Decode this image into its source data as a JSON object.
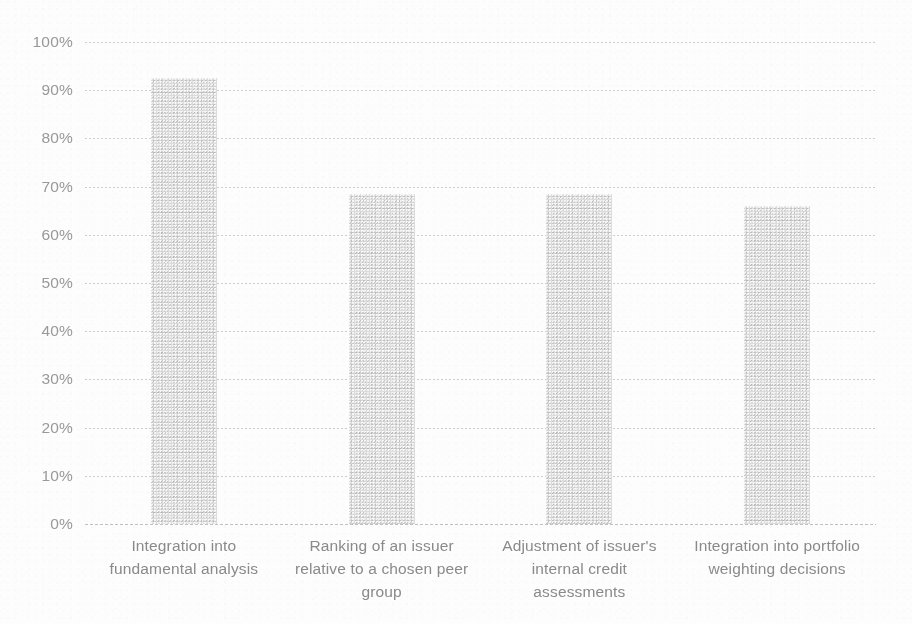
{
  "chart_data": {
    "type": "bar",
    "title": "",
    "subtitle": "",
    "xlabel": "",
    "ylabel": "",
    "ylim": [
      0,
      100
    ],
    "y_tick_labels": [
      "100%",
      "90%",
      "80%",
      "70%",
      "60%",
      "50%",
      "40%",
      "30%",
      "20%",
      "10%",
      "0%"
    ],
    "y_tick_values": [
      100,
      90,
      80,
      70,
      60,
      50,
      40,
      30,
      20,
      10,
      0
    ],
    "grid": "horizontal-dotted",
    "legend": "none",
    "categories": [
      "Integration into fundamental analysis",
      "Ranking of an issuer relative to a chosen peer group",
      "Adjustment of issuer's internal credit assessments",
      "Integration into portfolio weighting decisions"
    ],
    "values": [
      92.5,
      68.5,
      68.5,
      66
    ],
    "value_labels": [
      "",
      "",
      "",
      ""
    ],
    "bar_color": "#dcdcdc",
    "text_color": "#8a8a8a",
    "gridline_color": "#969696",
    "background_color": "#fdfdfd"
  },
  "axis": {
    "y_ticks": [
      {
        "label": "100%",
        "value": 100
      },
      {
        "label": "90%",
        "value": 90
      },
      {
        "label": "80%",
        "value": 80
      },
      {
        "label": "70%",
        "value": 70
      },
      {
        "label": "60%",
        "value": 60
      },
      {
        "label": "50%",
        "value": 50
      },
      {
        "label": "40%",
        "value": 40
      },
      {
        "label": "30%",
        "value": 30
      },
      {
        "label": "20%",
        "value": 20
      },
      {
        "label": "10%",
        "value": 10
      },
      {
        "label": "0%",
        "value": 0
      }
    ]
  },
  "categories": [
    {
      "line1": "Integration into",
      "line2": "fundamental analysis",
      "line3": ""
    },
    {
      "line1": "Ranking of an issuer",
      "line2": "relative to a chosen peer",
      "line3": "group"
    },
    {
      "line1": "Adjustment of issuer's",
      "line2": "internal credit",
      "line3": "assessments"
    },
    {
      "line1": "Integration into portfolio",
      "line2": "weighting decisions",
      "line3": ""
    }
  ]
}
